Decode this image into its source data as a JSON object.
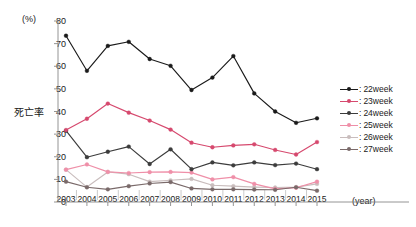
{
  "chart_data": {
    "type": "line",
    "title": "",
    "xlabel": "(year)",
    "ylabel": "死亡率",
    "yunit": "(%)",
    "ylim": [
      0,
      80
    ],
    "yticks": [
      0,
      10,
      20,
      30,
      40,
      50,
      60,
      70,
      80
    ],
    "grid": false,
    "legend_position": "right",
    "categories": [
      "2003",
      "2004",
      "2005",
      "2006",
      "2007",
      "2008",
      "2009",
      "2010",
      "2011",
      "2012",
      "2013",
      "2014",
      "2015"
    ],
    "series": [
      {
        "name": "22week",
        "label": "22week",
        "color": "#1a1a1a",
        "values": [
          73.5,
          58.0,
          69.0,
          70.8,
          63.2,
          60.2,
          49.5,
          55.0,
          64.5,
          48.0,
          40.0,
          35.0,
          37.0
        ]
      },
      {
        "name": "23week",
        "label": "23week",
        "color": "#d6496e",
        "values": [
          31.8,
          36.8,
          43.5,
          39.5,
          36.0,
          32.0,
          26.2,
          24.2,
          25.0,
          25.5,
          23.0,
          21.0,
          26.5
        ]
      },
      {
        "name": "24week",
        "label": "24week",
        "color": "#3c3c3c",
        "values": [
          31.5,
          19.8,
          22.2,
          24.5,
          16.8,
          23.3,
          14.5,
          17.5,
          16.2,
          17.5,
          16.3,
          17.0,
          14.5
        ]
      },
      {
        "name": "25week",
        "label": "25week",
        "color": "#ef8fa8",
        "values": [
          14.3,
          16.6,
          13.3,
          12.8,
          13.2,
          13.3,
          13.0,
          10.0,
          11.0,
          8.0,
          5.8,
          6.3,
          9.0
        ]
      },
      {
        "name": "26week",
        "label": "26week",
        "color": "#c9bdbd",
        "values": [
          14.3,
          6.6,
          13.3,
          12.3,
          9.0,
          9.6,
          10.2,
          7.4,
          7.0,
          6.6,
          6.4,
          6.6,
          8.0
        ]
      },
      {
        "name": "27week",
        "label": "27week",
        "color": "#7a6a6a",
        "values": [
          9.0,
          6.5,
          5.6,
          7.0,
          8.2,
          8.8,
          6.0,
          5.6,
          5.6,
          5.5,
          5.4,
          6.5,
          5.0
        ]
      }
    ]
  },
  "legend": {
    "colon": ":",
    "items": [
      {
        "label": "22week",
        "color": "#1a1a1a"
      },
      {
        "label": "23week",
        "color": "#d6496e"
      },
      {
        "label": "24week",
        "color": "#3c3c3c"
      },
      {
        "label": "25week",
        "color": "#ef8fa8"
      },
      {
        "label": "26week",
        "color": "#c9bdbd"
      },
      {
        "label": "27week",
        "color": "#7a6a6a"
      }
    ]
  }
}
